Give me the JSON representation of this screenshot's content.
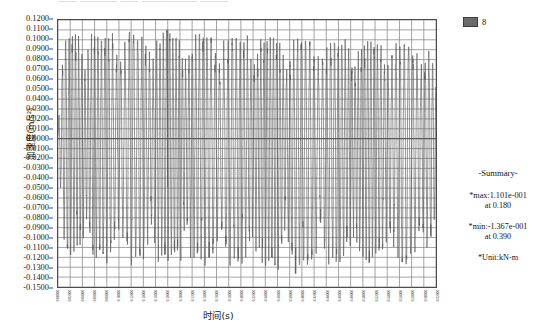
{
  "title_strip": {
    "text": "——   ————  ——   ——————  ———"
  },
  "legend": {
    "swatch_color": "#6b6b6b",
    "items": [
      {
        "label": "8"
      }
    ]
  },
  "summary": {
    "heading": "-Summary-",
    "max_line1": "*max:1.101e-001",
    "max_line2": "at 0.180",
    "min_line1": "*min:-1.367e-001",
    "min_line2": "at 0.390",
    "unit_line": "*Unit:kN-m"
  },
  "chart_data": {
    "type": "line",
    "title": "",
    "xlabel": "时间(s)",
    "ylabel": "加速度(m/s²)",
    "xlim": [
      0.0,
      0.62
    ],
    "ylim": [
      -0.15,
      0.12
    ],
    "grid": true,
    "legend_position": "top-right",
    "series_color": "#5a5a5a",
    "grid_color": "#8c8c8c",
    "axis_color": "#4c4c4c",
    "ytick_labels": [
      "0.1200",
      "0.1100",
      "0.1000",
      "0.0900",
      "0.0800",
      "0.0700",
      "0.0600",
      "0.0500",
      "0.0400",
      "0.0300",
      "0.0200",
      "0.0100",
      "0.0000",
      "-0.0100",
      "-0.0200",
      "-0.0300",
      "-0.0400",
      "-0.0500",
      "-0.0600",
      "-0.0700",
      "-0.0800",
      "-0.0900",
      "-0.1000",
      "-0.1100",
      "-0.1200",
      "-0.1300",
      "-0.1400",
      "-0.1500"
    ],
    "ytick_values": [
      0.12,
      0.11,
      0.1,
      0.09,
      0.08,
      0.07,
      0.06,
      0.05,
      0.04,
      0.03,
      0.02,
      0.01,
      0.0,
      -0.01,
      -0.02,
      -0.03,
      -0.04,
      -0.05,
      -0.06,
      -0.07,
      -0.08,
      -0.09,
      -0.1,
      -0.11,
      -0.12,
      -0.13,
      -0.14,
      -0.15
    ],
    "xtick_labels": [
      "0.00000",
      "0.02000",
      "0.04000",
      "0.06000",
      "0.08000",
      "0.10000",
      "0.12000",
      "0.14000",
      "0.16000",
      "0.18000",
      "0.20000",
      "0.22000",
      "0.24000",
      "0.26000",
      "0.28000",
      "0.30000",
      "0.32000",
      "0.34000",
      "0.36000",
      "0.38000",
      "0.40000",
      "0.42000",
      "0.44000",
      "0.46000",
      "0.48000",
      "0.50000",
      "0.52000",
      "0.54000",
      "0.56000",
      "0.58000",
      "0.60000",
      "0.62000"
    ],
    "xtick_values": [
      0.0,
      0.02,
      0.04,
      0.06,
      0.08,
      0.1,
      0.12,
      0.14,
      0.16,
      0.18,
      0.2,
      0.22,
      0.24,
      0.26,
      0.28,
      0.3,
      0.32,
      0.34,
      0.36,
      0.38,
      0.4,
      0.42,
      0.44,
      0.46,
      0.48,
      0.5,
      0.52,
      0.54,
      0.56,
      0.58,
      0.6,
      0.62
    ],
    "max_value": 0.1101,
    "max_time": 0.18,
    "min_value": -0.1367,
    "min_time": 0.39,
    "unit": "kN-m",
    "envelope": [
      {
        "t": 0.0,
        "pos": 0.01,
        "neg": -0.012
      },
      {
        "t": 0.01,
        "pos": 0.098,
        "neg": -0.102
      },
      {
        "t": 0.02,
        "pos": 0.102,
        "neg": -0.118
      },
      {
        "t": 0.03,
        "pos": 0.106,
        "neg": -0.112
      },
      {
        "t": 0.04,
        "pos": 0.1,
        "neg": -0.12
      },
      {
        "t": 0.05,
        "pos": 0.104,
        "neg": -0.108
      },
      {
        "t": 0.06,
        "pos": 0.108,
        "neg": -0.124
      },
      {
        "t": 0.07,
        "pos": 0.098,
        "neg": -0.11
      },
      {
        "t": 0.08,
        "pos": 0.103,
        "neg": -0.126
      },
      {
        "t": 0.09,
        "pos": 0.107,
        "neg": -0.114
      },
      {
        "t": 0.1,
        "pos": 0.101,
        "neg": -0.12
      },
      {
        "t": 0.11,
        "pos": 0.105,
        "neg": -0.109
      },
      {
        "t": 0.12,
        "pos": 0.109,
        "neg": -0.128
      },
      {
        "t": 0.13,
        "pos": 0.099,
        "neg": -0.116
      },
      {
        "t": 0.14,
        "pos": 0.104,
        "neg": -0.122
      },
      {
        "t": 0.15,
        "pos": 0.108,
        "neg": -0.111
      },
      {
        "t": 0.16,
        "pos": 0.102,
        "neg": -0.13
      },
      {
        "t": 0.17,
        "pos": 0.106,
        "neg": -0.118
      },
      {
        "t": 0.18,
        "pos": 0.1101,
        "neg": -0.124
      },
      {
        "t": 0.19,
        "pos": 0.1,
        "neg": -0.113
      },
      {
        "t": 0.2,
        "pos": 0.105,
        "neg": -0.127
      },
      {
        "t": 0.21,
        "pos": 0.099,
        "neg": -0.119
      },
      {
        "t": 0.22,
        "pos": 0.103,
        "neg": -0.125
      },
      {
        "t": 0.23,
        "pos": 0.107,
        "neg": -0.115
      },
      {
        "t": 0.24,
        "pos": 0.101,
        "neg": -0.129
      },
      {
        "t": 0.25,
        "pos": 0.104,
        "neg": -0.121
      },
      {
        "t": 0.26,
        "pos": 0.098,
        "neg": -0.126
      },
      {
        "t": 0.27,
        "pos": 0.106,
        "neg": -0.117
      },
      {
        "t": 0.28,
        "pos": 0.1,
        "neg": -0.131
      },
      {
        "t": 0.29,
        "pos": 0.103,
        "neg": -0.12
      },
      {
        "t": 0.3,
        "pos": 0.097,
        "neg": -0.128
      },
      {
        "t": 0.31,
        "pos": 0.105,
        "neg": -0.118
      },
      {
        "t": 0.32,
        "pos": 0.099,
        "neg": -0.133
      },
      {
        "t": 0.33,
        "pos": 0.102,
        "neg": -0.122
      },
      {
        "t": 0.34,
        "pos": 0.096,
        "neg": -0.129
      },
      {
        "t": 0.35,
        "pos": 0.104,
        "neg": -0.119
      },
      {
        "t": 0.36,
        "pos": 0.098,
        "neg": -0.134
      },
      {
        "t": 0.37,
        "pos": 0.101,
        "neg": -0.123
      },
      {
        "t": 0.38,
        "pos": 0.095,
        "neg": -0.13
      },
      {
        "t": 0.39,
        "pos": 0.103,
        "neg": -0.1367
      },
      {
        "t": 0.4,
        "pos": 0.097,
        "neg": -0.121
      },
      {
        "t": 0.41,
        "pos": 0.1,
        "neg": -0.128
      },
      {
        "t": 0.42,
        "pos": 0.094,
        "neg": -0.118
      },
      {
        "t": 0.43,
        "pos": 0.102,
        "neg": -0.125
      },
      {
        "t": 0.44,
        "pos": 0.096,
        "neg": -0.132
      },
      {
        "t": 0.45,
        "pos": 0.099,
        "neg": -0.12
      },
      {
        "t": 0.46,
        "pos": 0.093,
        "neg": -0.127
      },
      {
        "t": 0.47,
        "pos": 0.101,
        "neg": -0.117
      },
      {
        "t": 0.48,
        "pos": 0.095,
        "neg": -0.124
      },
      {
        "t": 0.49,
        "pos": 0.098,
        "neg": -0.131
      },
      {
        "t": 0.5,
        "pos": 0.092,
        "neg": -0.119
      },
      {
        "t": 0.51,
        "pos": 0.1,
        "neg": -0.126
      },
      {
        "t": 0.52,
        "pos": 0.094,
        "neg": -0.115
      },
      {
        "t": 0.53,
        "pos": 0.097,
        "neg": -0.123
      },
      {
        "t": 0.54,
        "pos": 0.091,
        "neg": -0.129
      },
      {
        "t": 0.55,
        "pos": 0.099,
        "neg": -0.116
      },
      {
        "t": 0.56,
        "pos": 0.093,
        "neg": -0.122
      },
      {
        "t": 0.57,
        "pos": 0.096,
        "neg": -0.128
      },
      {
        "t": 0.58,
        "pos": 0.09,
        "neg": -0.114
      },
      {
        "t": 0.59,
        "pos": 0.098,
        "neg": -0.121
      },
      {
        "t": 0.6,
        "pos": 0.092,
        "neg": -0.118
      },
      {
        "t": 0.61,
        "pos": 0.088,
        "neg": -0.11
      },
      {
        "t": 0.62,
        "pos": 0.06,
        "neg": -0.07
      }
    ]
  }
}
